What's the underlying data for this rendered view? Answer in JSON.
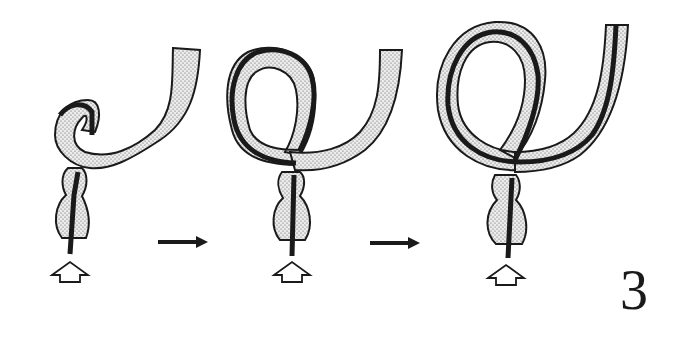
{
  "figure": {
    "number": "3",
    "panels": [
      {
        "id": "stage-1",
        "description": "colon segment beginning to loop with endoscope at tip"
      },
      {
        "id": "stage-2",
        "description": "loop formed with endoscope advanced through loop"
      },
      {
        "id": "stage-3",
        "description": "full loop with endoscope reaching proximal colon"
      }
    ],
    "transitions": [
      "arrow-right",
      "arrow-right"
    ],
    "insertion_indicators": [
      "up-arrow",
      "up-arrow",
      "up-arrow"
    ],
    "colors": {
      "outline": "#1a1a1a",
      "scope": "#1a1a1a",
      "fill": "#dcdcdc",
      "background": "#ffffff"
    }
  }
}
